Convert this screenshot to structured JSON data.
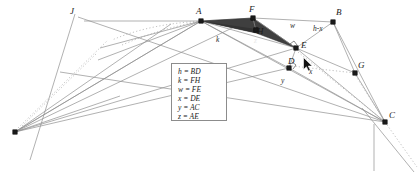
{
  "diagram": {
    "background_color": "#ffffff",
    "line_color": "#7d7d7d",
    "accent_line_color": "#9a9a9a",
    "shade_color": "#3a3a3a",
    "marker_color": "#1a1a1a",
    "label_color": "#1a1a1a"
  },
  "points": [
    {
      "id": "J",
      "label": "J",
      "x": 100,
      "y": 48,
      "label_x": 70,
      "label_y": 7,
      "marked": false
    },
    {
      "id": "A",
      "label": "A",
      "x": 201,
      "y": 21,
      "label_x": 196,
      "label_y": 7,
      "marked": true
    },
    {
      "id": "F",
      "label": "F",
      "x": 253,
      "y": 18,
      "label_x": 249,
      "label_y": 5,
      "marked": true
    },
    {
      "id": "B",
      "label": "B",
      "x": 333,
      "y": 22,
      "label_x": 336,
      "label_y": 8,
      "marked": true
    },
    {
      "id": "H",
      "label": "H",
      "x": 256,
      "y": 30,
      "label_x": 257,
      "label_y": 27,
      "marked": true
    },
    {
      "id": "E",
      "label": "E",
      "x": 296,
      "y": 48,
      "label_x": 301,
      "label_y": 41,
      "marked": true
    },
    {
      "id": "D",
      "label": "D",
      "x": 289,
      "y": 68,
      "label_x": 288,
      "label_y": 57,
      "marked": true
    },
    {
      "id": "G",
      "label": "G",
      "x": 355,
      "y": 73,
      "label_x": 358,
      "label_y": 61,
      "marked": true
    },
    {
      "id": "C",
      "label": "C",
      "x": 385,
      "y": 122,
      "label_x": 389,
      "label_y": 111,
      "marked": true
    },
    {
      "id": "L",
      "label": "",
      "x": 15,
      "y": 132,
      "label_x": 0,
      "label_y": 0,
      "marked": true
    }
  ],
  "segment_labels": [
    {
      "id": "k",
      "text": "k",
      "x": 216,
      "y": 36,
      "on_dark": false
    },
    {
      "id": "z",
      "text": "z",
      "x": 254,
      "y": 37,
      "on_dark": true
    },
    {
      "id": "w",
      "text": "w",
      "x": 290,
      "y": 22,
      "on_dark": false
    },
    {
      "id": "hmx",
      "text": "h-x",
      "x": 313,
      "y": 25,
      "on_dark": false
    },
    {
      "id": "x",
      "text": "x",
      "x": 309,
      "y": 68,
      "on_dark": false
    },
    {
      "id": "y",
      "text": "y",
      "x": 281,
      "y": 77,
      "on_dark": false
    }
  ],
  "legend": {
    "rows": [
      {
        "symbol": "h",
        "equals": "=",
        "value": "BD"
      },
      {
        "symbol": "k",
        "equals": "=",
        "value": "FH"
      },
      {
        "symbol": "w",
        "equals": "=",
        "value": "FE"
      },
      {
        "symbol": "x",
        "equals": "=",
        "value": "DE"
      },
      {
        "symbol": "y",
        "equals": "=",
        "value": "AC"
      },
      {
        "symbol": "z",
        "equals": "=",
        "value": "AE"
      }
    ]
  },
  "cursor": {
    "name": "mouse-pointer",
    "x": 303,
    "y": 57
  },
  "chart_data": {
    "type": "diagram",
    "vertices": {
      "J": [
        100,
        48
      ],
      "A": [
        201,
        21
      ],
      "F": [
        253,
        18
      ],
      "B": [
        333,
        22
      ],
      "H": [
        256,
        30
      ],
      "E": [
        296,
        48
      ],
      "D": [
        289,
        68
      ],
      "G": [
        355,
        73
      ],
      "C": [
        385,
        122
      ],
      "L": [
        15,
        132
      ]
    },
    "measurements": [
      "h = BD",
      "k = FH",
      "w = FE",
      "x = DE",
      "y = AC",
      "z = AE"
    ],
    "edge_labels": [
      "k",
      "z",
      "w",
      "h-x",
      "x",
      "y"
    ]
  }
}
